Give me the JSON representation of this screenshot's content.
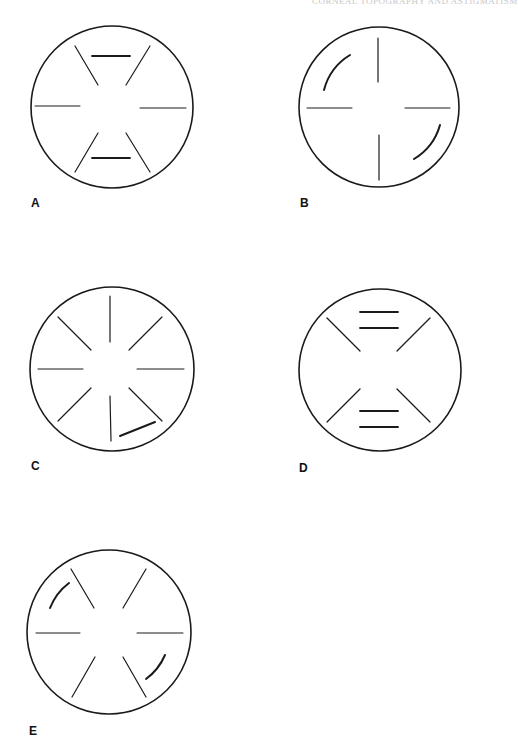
{
  "running_head": "CORNEAL TOPOGRAPHY AND ASTIGMATISM",
  "panels": [
    {
      "label": "A",
      "description": "Hourglass keratoscope pattern: two short horizontal bars above and below center, four oblique spokes, two horizontal spokes"
    },
    {
      "label": "B",
      "description": "Four cardinal spokes with two curved arcs in upper-left and lower-right quadrants"
    },
    {
      "label": "C",
      "description": "Eight radial spokes with one displaced oblique segment near lower right"
    },
    {
      "label": "D",
      "description": "Four oblique spokes with paired horizontal bars above and below center"
    },
    {
      "label": "E",
      "description": "Six spokes (four oblique, two horizontal) with two curved arcs in upper-left and lower-right"
    }
  ],
  "colors": {
    "stroke": "#1a1a1a",
    "background": "#ffffff"
  }
}
